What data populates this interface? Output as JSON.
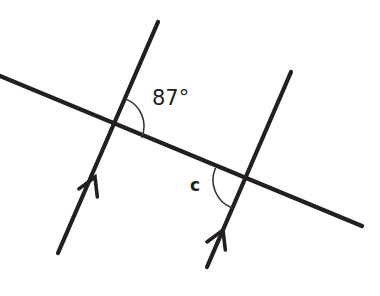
{
  "figure": {
    "type": "geometry-diagram",
    "background_color": "#ffffff",
    "stroke_color": "#231f20",
    "arc_color": "#3a3537"
  },
  "labels": {
    "angle_top": "87°",
    "angle_bottom": "c"
  },
  "label_positions": {
    "angle_top": {
      "x": 152,
      "y": 99
    },
    "angle_bottom": {
      "x": 190,
      "y": 186
    }
  },
  "lines": [
    {
      "name": "transversal",
      "x1": 0,
      "y1": 76,
      "x2": 362,
      "y2": 226,
      "marker": "none"
    },
    {
      "name": "parallel-line-left",
      "x1": 158,
      "y1": 22,
      "x2": 58,
      "y2": 253,
      "marker": "single-arrow"
    },
    {
      "name": "parallel-line-right",
      "x1": 291,
      "y1": 72,
      "x2": 207,
      "y2": 267,
      "marker": "single-arrow"
    }
  ],
  "arrow_markers": [
    {
      "name": "arrow-left-line",
      "x": 95,
      "y": 177,
      "angle_deg": -66.6
    },
    {
      "name": "arrow-right-line",
      "x": 223,
      "y": 230,
      "angle_deg": -66.7
    }
  ],
  "intersections": [
    {
      "name": "intersection-left",
      "x": 115,
      "y": 126
    },
    {
      "name": "intersection-right",
      "x": 243,
      "y": 180
    }
  ],
  "arcs": [
    {
      "name": "arc-87-degrees",
      "center_x": 115,
      "center_y": 126,
      "radius": 29,
      "start_angle_deg": -66.6,
      "end_angle_deg": 22.5
    },
    {
      "name": "arc-c",
      "center_x": 243,
      "center_y": 180,
      "radius": 30,
      "start_angle_deg": 202.5,
      "end_angle_deg": 113.3
    }
  ],
  "chart_data": {
    "type": "diagram",
    "title": "",
    "measures": [
      {
        "label": "87°",
        "value": 87,
        "unit": "degrees",
        "at": "intersection-left"
      },
      {
        "label": "c",
        "value": null,
        "unit": "degrees",
        "at": "intersection-right"
      }
    ]
  }
}
